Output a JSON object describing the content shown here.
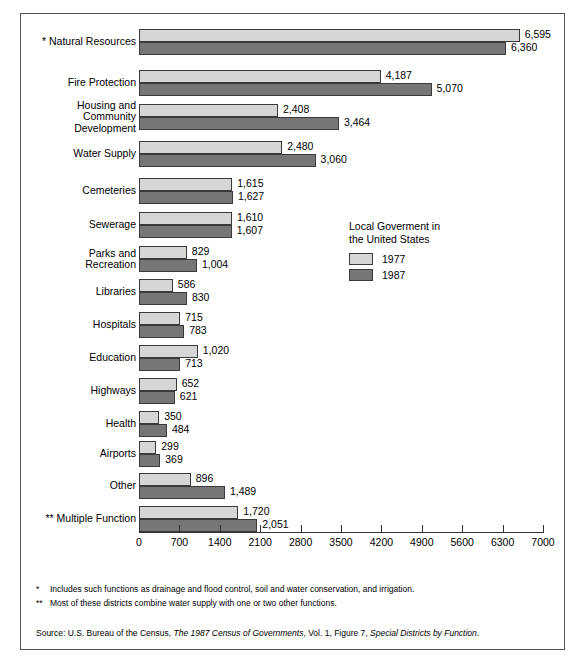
{
  "chart_data": {
    "type": "bar",
    "orientation": "horizontal",
    "title": "",
    "xlabel": "",
    "ylabel": "",
    "xlim": [
      0,
      7000
    ],
    "xticks": [
      0,
      700,
      1400,
      2100,
      2800,
      3500,
      4200,
      4900,
      5600,
      6300,
      7000
    ],
    "xtick_labels": [
      "0",
      "700",
      "1400",
      "2100",
      "2800",
      "3500",
      "4200",
      "4900",
      "5600",
      "6300",
      "7000"
    ],
    "grid": false,
    "legend_position": "middle-right",
    "categories": [
      "* Natural Resources",
      "Fire Protection",
      "Housing and\nCommunity\nDevelopment",
      "Water Supply",
      "Cemeteries",
      "Sewerage",
      "Parks and\nRecreation",
      "Libraries",
      "Hospitals",
      "Education",
      "Highways",
      "Health",
      "Airports",
      "Other",
      "** Multiple Function"
    ],
    "series": [
      {
        "name": "1977",
        "color": "#d6d6d6",
        "values": [
          6595,
          4187,
          2408,
          2480,
          1615,
          1610,
          829,
          586,
          715,
          1020,
          652,
          350,
          299,
          896,
          1720
        ],
        "labels": [
          "6,595",
          "4,187",
          "2,408",
          "2,480",
          "1,615",
          "1,610",
          "829",
          "586",
          "715",
          "1,020",
          "652",
          "350",
          "299",
          "896",
          "1,720"
        ]
      },
      {
        "name": "1987",
        "color": "#767676",
        "values": [
          6360,
          5070,
          3464,
          3060,
          1627,
          1607,
          1004,
          830,
          783,
          713,
          621,
          484,
          369,
          1489,
          2051
        ],
        "labels": [
          "6,360",
          "5,070",
          "3,464",
          "3,060",
          "1,627",
          "1,607",
          "1,004",
          "830",
          "783",
          "713",
          "621",
          "484",
          "369",
          "1,489",
          "2,051"
        ]
      }
    ]
  },
  "legend": {
    "title": "Local Goverment in\nthe United States",
    "items": [
      {
        "label": "1977",
        "color": "#d6d6d6"
      },
      {
        "label": "1987",
        "color": "#767676"
      }
    ]
  },
  "notes": [
    {
      "marker": "*",
      "text": "Includes such functions as drainage and flood control, soil and water conservation, and irrigation."
    },
    {
      "marker": "**",
      "text": "Most of these districts combine water supply with one or two other functions."
    }
  ],
  "source": {
    "prefix": "Source:  U.S. Bureau of the Census, ",
    "title1": "The 1987 Census of Governments",
    "middle": ", Vol. 1, Figure 7, ",
    "title2": "Special Districts by Function",
    "suffix": "."
  }
}
